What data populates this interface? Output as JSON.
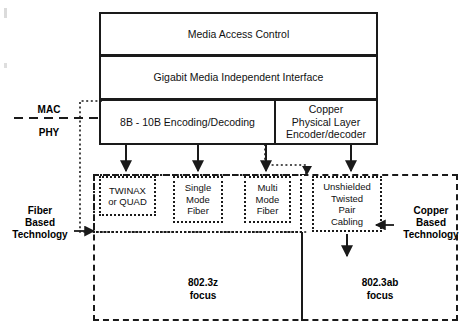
{
  "diagram": {
    "stack": {
      "mac": "Media Access Control",
      "gmii": "Gigabit Media Independent Interface",
      "encoding": "8B - 10B Encoding/Decoding",
      "copper_phy_line1": "Copper",
      "copper_phy_line2": "Physical Layer",
      "copper_phy_line3": "Encoder/decoder"
    },
    "boundary": {
      "upper": "MAC",
      "lower": "PHY"
    },
    "media": [
      {
        "name": "twinax",
        "line1": "TWINAX",
        "line2": "or QUAD"
      },
      {
        "name": "single-mode-fiber",
        "line1": "Single",
        "line2": "Mode",
        "line3": "Fiber"
      },
      {
        "name": "multi-mode-fiber",
        "line1": "Multi",
        "line2": "Mode",
        "line3": "Fiber"
      },
      {
        "name": "utp-cabling",
        "line1": "Unshielded",
        "line2": "Twisted",
        "line3": "Pair",
        "line4": "Cabling"
      }
    ],
    "annotations": {
      "fiber_based_line1": "Fiber",
      "fiber_based_line2": "Based",
      "fiber_based_line3": "Technology",
      "copper_based_line1": "Copper",
      "copper_based_line2": "Based",
      "copper_based_line3": "Technology"
    },
    "focus": {
      "left_standard": "802.3z",
      "left_word": "focus",
      "right_standard": "802.3ab",
      "right_word": "focus"
    },
    "colors": {
      "line": "#1a1a1a",
      "background": "#ffffff",
      "text": "#000000"
    }
  }
}
